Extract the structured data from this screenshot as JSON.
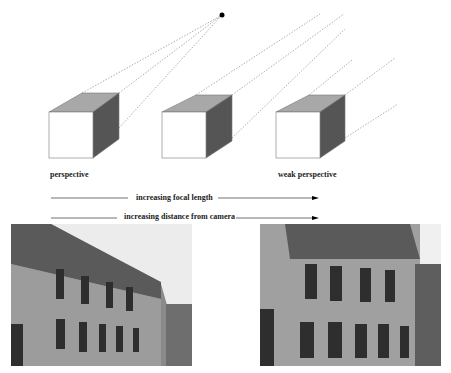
{
  "labels": {
    "perspective": "perspective",
    "weak_perspective": "weak perspective",
    "arrow1": "increasing  focal length",
    "arrow2": "increasing distance from camera"
  },
  "colors": {
    "front_face": "#ffffff",
    "top_face": "#a8a8a8",
    "side_face": "#555555",
    "projection_lines": "#9a9a9a",
    "text": "#222222"
  },
  "cubes": [
    {
      "name": "cube-perspective",
      "front": [
        49,
        112,
        93,
        158
      ],
      "depth": [
        33,
        -19
      ]
    },
    {
      "name": "cube-middle",
      "front": [
        162,
        112,
        206,
        158
      ],
      "depth": [
        34,
        -17
      ]
    },
    {
      "name": "cube-weak-perspective",
      "front": [
        276,
        112,
        320,
        158
      ],
      "depth": [
        34,
        -17
      ]
    }
  ],
  "center_of_projection": [
    222,
    15
  ],
  "photos": [
    {
      "name": "photo-building-far",
      "caption": ""
    },
    {
      "name": "photo-building-near",
      "caption": ""
    }
  ]
}
